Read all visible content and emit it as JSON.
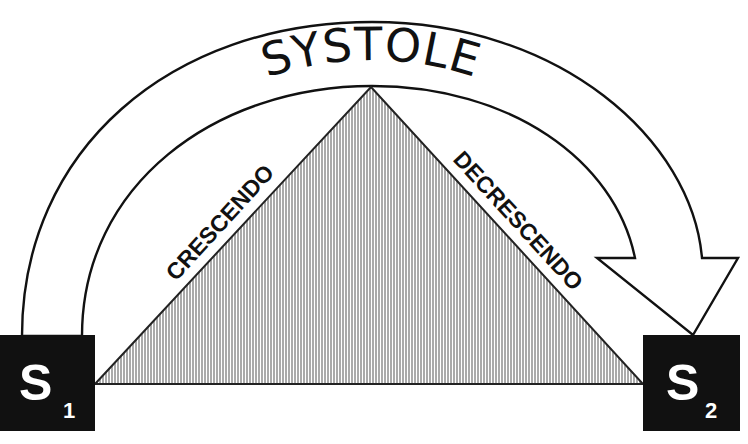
{
  "diagram": {
    "title": "SYSTOLE",
    "left_slope_label": "CRESCENDO",
    "right_slope_label": "DECRESCENDO",
    "s1": {
      "letter": "S",
      "subscript": "1"
    },
    "s2": {
      "letter": "S",
      "subscript": "2"
    },
    "colors": {
      "ink": "#111111",
      "box_fill": "#111111",
      "box_text": "#ffffff",
      "background": "#ffffff",
      "hatch": "#555555"
    }
  }
}
